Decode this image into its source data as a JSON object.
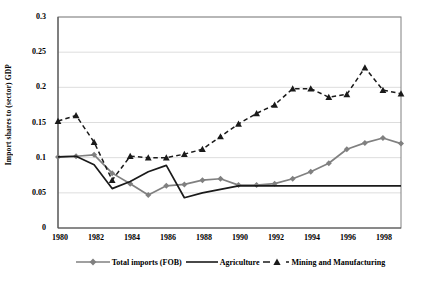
{
  "chart_data": {
    "type": "line",
    "title": "",
    "xlabel": "",
    "ylabel": "Import shares to (sector) GDP",
    "xlim": [
      1980,
      1999
    ],
    "ylim": [
      0,
      0.3
    ],
    "grid": true,
    "grid_axis": "y",
    "legend_position": "bottom",
    "x": [
      1980,
      1981,
      1982,
      1983,
      1984,
      1985,
      1986,
      1987,
      1988,
      1989,
      1990,
      1991,
      1992,
      1993,
      1994,
      1995,
      1996,
      1997,
      1998,
      1999
    ],
    "xticklabels": [
      "1980",
      "1982",
      "1984",
      "1986",
      "1988",
      "1990",
      "1992",
      "1994",
      "1996",
      "1998"
    ],
    "yticklabels": [
      "0",
      "0.05",
      "0.1",
      "0.15",
      "0.2",
      "0.25",
      "0.3"
    ],
    "yticks": [
      0,
      0.05,
      0.1,
      0.15,
      0.2,
      0.25,
      0.3
    ],
    "series": [
      {
        "name": "Total imports (FOB)",
        "color": "#808080",
        "style": "solid",
        "marker": "diamond",
        "values": [
          0.101,
          0.102,
          0.104,
          0.078,
          0.063,
          0.047,
          0.06,
          0.062,
          0.068,
          0.07,
          0.061,
          0.061,
          0.063,
          0.07,
          0.08,
          0.092,
          0.112,
          0.121,
          0.128,
          0.12
        ]
      },
      {
        "name": "Agriculture",
        "color": "#1a1a1a",
        "style": "solid",
        "marker": "none",
        "values": [
          0.101,
          0.102,
          0.09,
          0.056,
          0.066,
          0.08,
          0.089,
          0.043,
          0.05,
          0.055,
          0.06,
          0.06,
          0.06,
          0.06,
          0.06,
          0.06,
          0.06,
          0.06,
          0.06,
          0.06
        ]
      },
      {
        "name": "Mining and Manufacturing",
        "color": "#1a1a1a",
        "style": "dashed",
        "marker": "triangle",
        "values": [
          0.152,
          0.16,
          0.122,
          0.068,
          0.102,
          0.1,
          0.1,
          0.105,
          0.112,
          0.13,
          0.148,
          0.163,
          0.175,
          0.198,
          0.198,
          0.186,
          0.19,
          0.228,
          0.196,
          0.191
        ]
      }
    ]
  },
  "series_full": {
    "total_imports": {
      "label": "Total imports (FOB)",
      "points": [
        {
          "year": 1980,
          "value": 0.101
        },
        {
          "year": 1981,
          "value": 0.102
        },
        {
          "year": 1982,
          "value": 0.104
        },
        {
          "year": 1983,
          "value": 0.078
        },
        {
          "year": 1984,
          "value": 0.047
        },
        {
          "year": 1985,
          "value": 0.06
        },
        {
          "year": 1986,
          "value": 0.062
        },
        {
          "year": 1987,
          "value": 0.062
        },
        {
          "year": 1988,
          "value": 0.068
        },
        {
          "year": 1989,
          "value": 0.07
        },
        {
          "year": 1990,
          "value": 0.061
        },
        {
          "year": 1991,
          "value": 0.061
        },
        {
          "year": 1992,
          "value": 0.063
        },
        {
          "year": 1993,
          "value": 0.07
        },
        {
          "year": 1994,
          "value": 0.08
        },
        {
          "year": 1995,
          "value": 0.092
        },
        {
          "year": 1996,
          "value": 0.112
        },
        {
          "year": 1997,
          "value": 0.121
        },
        {
          "year": 1998,
          "value": 0.128
        },
        {
          "year": 1999,
          "value": 0.12
        }
      ]
    }
  },
  "legend": {
    "entries": [
      {
        "label": "Total imports (FOB)",
        "color": "#808080",
        "marker": "diamond",
        "dash": "solid"
      },
      {
        "label": "Agriculture",
        "color": "#1a1a1a",
        "marker": "none",
        "dash": "solid"
      },
      {
        "label": "Mining and Manufacturing",
        "color": "#1a1a1a",
        "marker": "triangle",
        "dash": "dashed"
      }
    ]
  },
  "axes": {
    "y_axis_title": "Import shares to (sector) GDP",
    "y_ticks": [
      "0.3",
      "0.25",
      "0.2",
      "0.15",
      "0.1",
      "0.05",
      "0"
    ],
    "x_ticks": [
      "1980",
      "1982",
      "1984",
      "1986",
      "1988",
      "1990",
      "1992",
      "1994",
      "1996",
      "1998"
    ]
  },
  "colors": {
    "gray_series": "#808080",
    "dark_series": "#1a1a1a",
    "gridline": "#d9d9d9",
    "axis": "#808080",
    "background": "#ffffff"
  }
}
